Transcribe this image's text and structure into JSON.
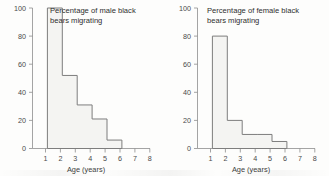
{
  "chart_data": [
    {
      "type": "bar",
      "title": "Percentage of male black bears migrating",
      "title_line1": "Percentage of male black",
      "title_line2": "bears migrating",
      "xlabel": "Age (years)",
      "ylabel": "",
      "categories": [
        "1-2",
        "2-3",
        "3-4",
        "4-5",
        "5-6"
      ],
      "bin_edges": [
        1,
        2,
        3,
        4,
        5,
        6
      ],
      "values": [
        100,
        52,
        31,
        21,
        6
      ],
      "x_ticks": [
        1,
        2,
        3,
        4,
        5,
        6,
        7,
        8
      ],
      "y_ticks": [
        0,
        20,
        40,
        60,
        80,
        100
      ],
      "xlim": [
        1,
        8
      ],
      "ylim": [
        0,
        100
      ],
      "grid": false,
      "legend": "none"
    },
    {
      "type": "bar",
      "title": "Percentage of female black bears migrating",
      "title_line1": "Percentage of female black",
      "title_line2": "bears migrating",
      "xlabel": "Age (years)",
      "ylabel": "",
      "categories": [
        "1-2",
        "2-3",
        "3-4",
        "4-5",
        "5-6"
      ],
      "bin_edges": [
        1,
        2,
        3,
        4,
        5,
        6
      ],
      "values": [
        80,
        20,
        10,
        10,
        5
      ],
      "x_ticks": [
        1,
        2,
        3,
        4,
        5,
        6,
        7,
        8
      ],
      "y_ticks": [
        0,
        20,
        40,
        60,
        80,
        100
      ],
      "xlim": [
        1,
        8
      ],
      "ylim": [
        0,
        100
      ],
      "grid": false,
      "legend": "none"
    }
  ],
  "left_chart": {
    "title_line1": "Percentage of male black",
    "title_line2": "bears migrating",
    "xlabel": "Age (years)",
    "y_tick_labels": [
      "100",
      "80",
      "60",
      "40",
      "20",
      "0"
    ],
    "x_tick_labels": [
      "1",
      "2",
      "3",
      "4",
      "5",
      "6",
      "7",
      "8"
    ]
  },
  "right_chart": {
    "title_line1": "Percentage of female black",
    "title_line2": "bears migrating",
    "xlabel": "Age (years)",
    "y_tick_labels": [
      "100",
      "80",
      "60",
      "40",
      "20",
      "0"
    ],
    "x_tick_labels": [
      "1",
      "2",
      "3",
      "4",
      "5",
      "6",
      "7",
      "8"
    ]
  },
  "colors": {
    "bar_fill": "#f4f4f2",
    "bar_stroke": "#7d7d7d",
    "axis": "#8d8d8d",
    "text": "#3d3d3d",
    "background": "#fdfdfc"
  }
}
